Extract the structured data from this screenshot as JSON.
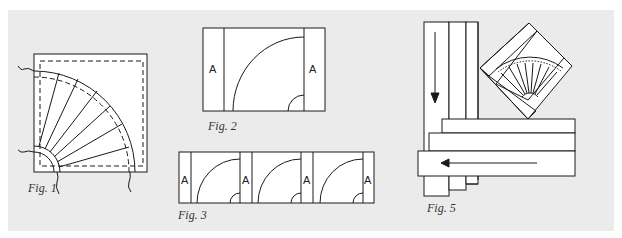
{
  "figures": {
    "fig1": {
      "caption": "Fig. 1",
      "description": "Quarter-circle fan block on square with dashed seam allowance and thread tails"
    },
    "fig2": {
      "caption": "Fig. 2",
      "description": "Fan block with sashing strips A on both sides",
      "strip_left": "A",
      "strip_right": "A"
    },
    "fig3": {
      "caption": "Fig. 3",
      "description": "Row of three fan blocks joined with A sashing strips",
      "strips": [
        "A",
        "A",
        "A",
        "A"
      ]
    },
    "fig5": {
      "caption": "Fig. 5",
      "description": "Border strips with directional arrows and on-point fan block"
    }
  },
  "colors": {
    "background_panel": "#ebebeb",
    "line": "#1a1a1a",
    "block_fill": "#ffffff"
  }
}
